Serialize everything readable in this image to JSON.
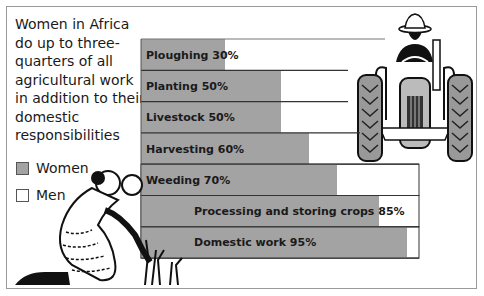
{
  "chart_data": {
    "type": "bar",
    "orientation": "horizontal",
    "title": "Women in Africa do up to three-quarters of all agricultural work in addition to their domestic responsibilities",
    "xlabel": "",
    "ylabel": "",
    "xlim": [
      0,
      100
    ],
    "grid": false,
    "legend_position": "left",
    "categories": [
      "Ploughing",
      "Planting",
      "Livestock",
      "Harvesting",
      "Weeding",
      "Processing and storing crops",
      "Domestic work"
    ],
    "series": [
      {
        "name": "Women",
        "color": "#a3a3a3",
        "values": [
          30,
          50,
          50,
          60,
          70,
          85,
          95
        ]
      },
      {
        "name": "Men",
        "color": "#ffffff",
        "values": [
          70,
          50,
          50,
          40,
          30,
          15,
          5
        ]
      }
    ],
    "labels": [
      "Ploughing 30%",
      "Planting 50%",
      "Livestock 50%",
      "Harvesting 60%",
      "Weeding 70%",
      "Processing and storing crops 85%",
      "Domestic work 95%"
    ],
    "legend": [
      {
        "label": "Women",
        "color": "#a3a3a3"
      },
      {
        "label": "Men",
        "color": "#ffffff"
      }
    ]
  },
  "illustrations": [
    "farmer-on-tractor",
    "woman-weeding-crops"
  ]
}
